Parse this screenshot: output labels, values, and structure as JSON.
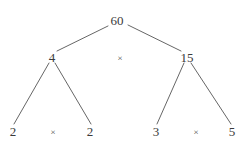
{
  "diagram": {
    "kind": "factor-tree",
    "stroke_color": "#555555",
    "text_color": "#3a3a3a",
    "background_color": "#ffffff",
    "nodes": [
      {
        "id": "root",
        "label": "60",
        "x": 117,
        "y": 20
      },
      {
        "id": "left",
        "label": "4",
        "x": 52,
        "y": 57
      },
      {
        "id": "right",
        "label": "15",
        "x": 187,
        "y": 57
      },
      {
        "id": "leaf-1",
        "label": "2",
        "x": 13,
        "y": 131
      },
      {
        "id": "leaf-2",
        "label": "2",
        "x": 90,
        "y": 131
      },
      {
        "id": "leaf-3",
        "label": "3",
        "x": 156,
        "y": 131
      },
      {
        "id": "leaf-4",
        "label": "5",
        "x": 232,
        "y": 131
      }
    ],
    "operators": [
      {
        "id": "op-top",
        "label": "×",
        "x": 120,
        "y": 58
      },
      {
        "id": "op-left",
        "label": "×",
        "x": 53,
        "y": 132
      },
      {
        "id": "op-right",
        "label": "×",
        "x": 196,
        "y": 132
      }
    ],
    "edges": [
      {
        "id": "root-to-left",
        "x1": 108,
        "y1": 26,
        "x2": 57,
        "y2": 51
      },
      {
        "id": "root-to-right",
        "x1": 128,
        "y1": 25,
        "x2": 181,
        "y2": 51
      },
      {
        "id": "left-to-leaf-1",
        "x1": 49,
        "y1": 63,
        "x2": 14,
        "y2": 124
      },
      {
        "id": "left-to-leaf-2",
        "x1": 55,
        "y1": 63,
        "x2": 91,
        "y2": 124
      },
      {
        "id": "right-to-leaf-3",
        "x1": 184,
        "y1": 63,
        "x2": 157,
        "y2": 124
      },
      {
        "id": "right-to-leaf-4",
        "x1": 191,
        "y1": 63,
        "x2": 231,
        "y2": 124
      }
    ]
  }
}
